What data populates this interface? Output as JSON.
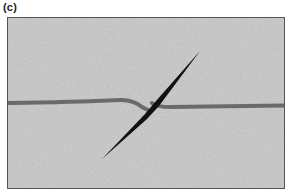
{
  "figure": {
    "panel_label": "(c)",
    "colors": {
      "background": "#cdcdcd",
      "frame_border": "#555555",
      "strand": "#6a6a6a",
      "needle": "#111111"
    }
  }
}
